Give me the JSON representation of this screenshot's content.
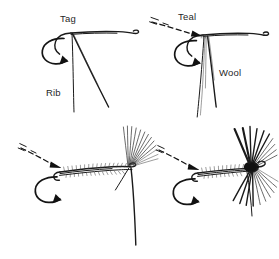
{
  "figure": {
    "background_color": "#ffffff",
    "ink_color": "#1a1a1a",
    "width": 279,
    "height": 259,
    "style": "hand-drawn pen and ink line illustration",
    "panel_count": 4
  },
  "labels": {
    "tag": "Tag",
    "rib": "Rib",
    "teal": "Teal",
    "wool": "Wool"
  },
  "panels": [
    {
      "id": "step-1",
      "position": "top-left",
      "labels": [
        "Tag",
        "Rib"
      ],
      "arrows": [
        "curved-rotation-arrow"
      ],
      "description": "Bare hook with tag and rib material tied in at the rear"
    },
    {
      "id": "step-2",
      "position": "top-right",
      "labels": [
        "Teal",
        "Wool"
      ],
      "arrows": [
        "dashed-motion-arrow",
        "curved-rotation-arrow"
      ],
      "description": "Teal fibre and wool tied in at the rear of the hook"
    },
    {
      "id": "step-3",
      "position": "bottom-left",
      "labels": [],
      "arrows": [
        "dashed-motion-arrow",
        "curved-rotation-arrow"
      ],
      "description": "Ribbed wool body wound forward with wing fibres set at the head"
    },
    {
      "id": "step-4",
      "position": "bottom-right",
      "labels": [],
      "arrows": [
        "dashed-motion-arrow",
        "curved-rotation-arrow"
      ],
      "description": "Finished wet fly with dark wing, hackle and whip finished head"
    }
  ]
}
